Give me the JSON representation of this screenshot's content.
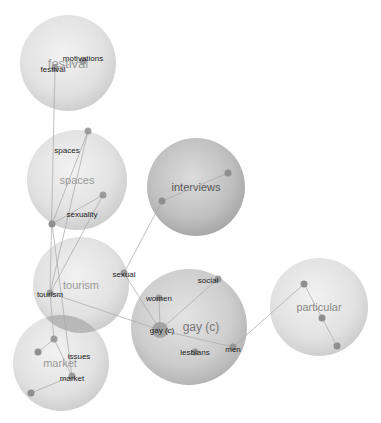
{
  "clusters": [
    {
      "id": "festival",
      "label": "festival",
      "cx": 68,
      "cy": 63,
      "r": 48,
      "shade": "light"
    },
    {
      "id": "spaces",
      "label": "spaces",
      "cx": 77,
      "cy": 180,
      "r": 50,
      "shade": "light"
    },
    {
      "id": "interviews",
      "label": "interviews",
      "cx": 196,
      "cy": 187,
      "r": 49,
      "shade": "dark"
    },
    {
      "id": "tourism",
      "label": "tourism",
      "cx": 81,
      "cy": 285,
      "r": 48,
      "shade": "light"
    },
    {
      "id": "market",
      "label": "market",
      "cx": 61,
      "cy": 363,
      "r": 48,
      "shade": "light"
    },
    {
      "id": "gay",
      "label": "gay (c)",
      "cx": 189,
      "cy": 327,
      "r": 58,
      "shade": "mid"
    },
    {
      "id": "particular",
      "label": "particular",
      "cx": 319,
      "cy": 307,
      "r": 49,
      "shade": "light"
    }
  ],
  "terms": [
    {
      "id": "motivations",
      "label": "motivations",
      "x": 83,
      "y": 58,
      "nx": 83,
      "ny": 61
    },
    {
      "id": "festival-term",
      "label": "festival",
      "x": 53,
      "y": 69,
      "nx": 55,
      "ny": 68
    },
    {
      "id": "spaces-term",
      "label": "spaces",
      "x": 67,
      "y": 150,
      "nx": 88,
      "ny": 131
    },
    {
      "id": "sexuality",
      "label": "sexuality",
      "x": 82,
      "y": 214,
      "nx": 103,
      "ny": 195
    },
    {
      "id": "sexual",
      "label": "sexual",
      "x": 124,
      "y": 274,
      "nx": 124,
      "ny": 273
    },
    {
      "id": "tourism-term",
      "label": "tourism",
      "x": 50,
      "y": 294,
      "nx": 50,
      "ny": 293
    },
    {
      "id": "issues",
      "label": "issues",
      "x": 79,
      "y": 356,
      "nx": 54,
      "ny": 339
    },
    {
      "id": "market-term",
      "label": "market",
      "x": 72,
      "y": 378,
      "nx": 72,
      "ny": 376
    },
    {
      "id": "women",
      "label": "women",
      "x": 159,
      "y": 298,
      "nx": 159,
      "ny": 298
    },
    {
      "id": "social",
      "label": "social",
      "x": 208,
      "y": 280,
      "nx": 218,
      "ny": 279
    },
    {
      "id": "gay-term",
      "label": "gay (c)",
      "x": 162,
      "y": 330,
      "nx": 160,
      "ny": 330
    },
    {
      "id": "lesbians",
      "label": "lesbians",
      "x": 195,
      "y": 352,
      "nx": 195,
      "ny": 352
    },
    {
      "id": "men",
      "label": "men",
      "x": 233,
      "y": 349,
      "nx": 233,
      "ny": 347
    }
  ],
  "extra_nodes": [
    {
      "id": "interviews-a",
      "x": 162,
      "y": 201
    },
    {
      "id": "interviews-b",
      "x": 228,
      "y": 173
    },
    {
      "id": "spaces-c",
      "x": 52,
      "y": 224
    },
    {
      "id": "market-a",
      "x": 38,
      "y": 352
    },
    {
      "id": "market-b",
      "x": 31,
      "y": 393
    },
    {
      "id": "particular-a",
      "x": 304,
      "y": 284
    },
    {
      "id": "particular-b",
      "x": 337,
      "y": 346
    },
    {
      "id": "particular-c",
      "x": 322,
      "y": 318
    }
  ],
  "edges": [
    [
      "festival-term",
      "tourism-term"
    ],
    [
      "motivations",
      "festival-term"
    ],
    [
      "spaces-term",
      "spaces-c"
    ],
    [
      "spaces-term",
      "tourism-term"
    ],
    [
      "sexuality",
      "spaces-c"
    ],
    [
      "sexuality",
      "tourism-term"
    ],
    [
      "interviews-a",
      "interviews-b"
    ],
    [
      "interviews-a",
      "sexual"
    ],
    [
      "spaces-c",
      "market-term"
    ],
    [
      "tourism-term",
      "gay-term"
    ],
    [
      "tourism-term",
      "issues"
    ],
    [
      "issues",
      "market-a"
    ],
    [
      "issues",
      "market-term"
    ],
    [
      "market-term",
      "market-b"
    ],
    [
      "sexual",
      "gay-term"
    ],
    [
      "women",
      "gay-term"
    ],
    [
      "social",
      "gay-term"
    ],
    [
      "gay-term",
      "men"
    ],
    [
      "men",
      "particular-a"
    ],
    [
      "particular-a",
      "particular-c"
    ],
    [
      "particular-c",
      "particular-b"
    ]
  ],
  "overlap": {
    "cx": 71,
    "cy": 325,
    "note": "dark overlap between tourism and market clusters"
  },
  "footer_caption": ""
}
